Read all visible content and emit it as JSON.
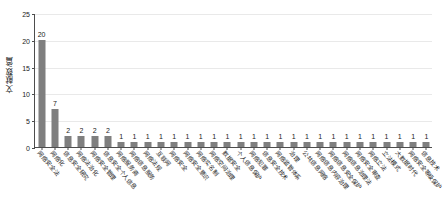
{
  "chart_data": {
    "type": "bar",
    "title": "",
    "xlabel": "",
    "ylabel": "文献数/篇",
    "ylim": [
      0,
      25
    ],
    "yticks": [
      0,
      5,
      10,
      15,
      20,
      25
    ],
    "grid": true,
    "legend": "none",
    "bar_color": "#7f7f7f",
    "show_value_labels": true,
    "categories": [
      "网络安全法",
      "网络化",
      "信息安全研究",
      "网络法治化",
      "网络安全管理",
      "信息安全个人信息",
      "网络服务商",
      "网络信息服务",
      "网络法规",
      "互联网",
      "网络安全",
      "网络安全意识",
      "网络实名制",
      "网络空间治理",
      "数据安全",
      "个人信息保护",
      "网络犯罪",
      "信息安全技术",
      "网络监管体系",
      "治理",
      "公共信息网络",
      "网络信息内容治理",
      "网络信息安全保护",
      "网络信息治理法",
      "网络安全审查",
      "网络立法",
      "立法模式",
      "大数据时代",
      "网络安全等级保护",
      "信息技术"
    ],
    "values": [
      20,
      7,
      2,
      2,
      2,
      2,
      1,
      1,
      1,
      1,
      1,
      1,
      1,
      1,
      1,
      1,
      1,
      1,
      1,
      1,
      1,
      1,
      1,
      1,
      1,
      1,
      1,
      1,
      1,
      1
    ]
  }
}
